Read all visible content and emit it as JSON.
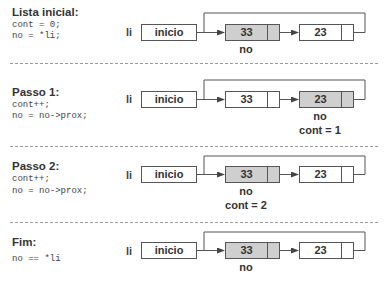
{
  "steps": [
    {
      "title": "Lista inicial:",
      "code": [
        "cont = 0;",
        "no = *li;"
      ],
      "list_label": "li",
      "head_label": "inicio",
      "nodes": [
        {
          "value": "33",
          "highlighted": true
        },
        {
          "value": "23",
          "highlighted": false
        }
      ],
      "pointer_label": "no",
      "pointer_node": 0,
      "counter": ""
    },
    {
      "title": "Passo 1:",
      "code": [
        "cont++;",
        "no = no->prox;"
      ],
      "list_label": "li",
      "head_label": "inicio",
      "nodes": [
        {
          "value": "33",
          "highlighted": false
        },
        {
          "value": "23",
          "highlighted": true
        }
      ],
      "pointer_label": "no",
      "pointer_node": 1,
      "counter": "cont = 1"
    },
    {
      "title": "Passo 2:",
      "code": [
        "cont++;",
        "no = no->prox;"
      ],
      "list_label": "li",
      "head_label": "inicio",
      "nodes": [
        {
          "value": "33",
          "highlighted": true
        },
        {
          "value": "23",
          "highlighted": false
        }
      ],
      "pointer_label": "no",
      "pointer_node": 0,
      "counter": "cont = 2"
    },
    {
      "title": "Fim:",
      "code": [
        "no == *li"
      ],
      "list_label": "li",
      "head_label": "inicio",
      "nodes": [
        {
          "value": "33",
          "highlighted": true
        },
        {
          "value": "23",
          "highlighted": false
        }
      ],
      "pointer_label": "no",
      "pointer_node": 0,
      "counter": ""
    }
  ],
  "colors": {
    "highlight": "#cfcfcf",
    "line": "#555555",
    "divider": "#9a9a9a"
  }
}
